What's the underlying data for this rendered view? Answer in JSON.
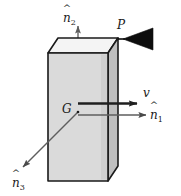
{
  "figure": {
    "type": "mechanics-free-body-diagram",
    "width": 181,
    "height": 196,
    "background_color": "#ffffff"
  },
  "labels": {
    "point_p": "P",
    "point_g": "G",
    "velocity": "v",
    "n1_base": "n",
    "n1_sub": "1",
    "n2_base": "n",
    "n2_sub": "2",
    "n3_base": "n",
    "n3_sub": "3",
    "hat_mark": "^"
  },
  "colors": {
    "outline": "#1a1a1a",
    "face_front": "#d9d9d9",
    "face_right": "#bdbdbd",
    "face_top": "#f2f2f2",
    "arrow_dark": "#1f1f1f",
    "arrow_gray": "#6e6e6e",
    "impactor_fill": "#0d0d0d"
  },
  "geometry": {
    "front_face": {
      "x": 48,
      "y": 53,
      "width": 60,
      "height": 128
    },
    "depth_offset": {
      "dx": 10,
      "dy": -15
    },
    "point_g": {
      "x": 78,
      "y": 112
    },
    "point_p": {
      "x": 118,
      "y": 38
    },
    "n1_arrow": {
      "x1": 78,
      "y1": 115,
      "x2": 152,
      "y2": 115
    },
    "n2_arrow": {
      "x1": 78,
      "y1": 112,
      "x2": 78,
      "y2": 26
    },
    "n3_arrow": {
      "x1": 78,
      "y1": 112,
      "x2": 19,
      "y2": 171
    },
    "v_arrow": {
      "x1": 78,
      "y1": 103,
      "x2": 144,
      "y2": 103
    },
    "impactor_triangle": {
      "apex_x": 122,
      "apex_y": 39,
      "base_x": 152,
      "top_y": 29,
      "bottom_y": 49
    }
  },
  "elements": [
    {
      "name": "rigid-body-prism",
      "kind": "shape"
    },
    {
      "name": "center-of-mass-marker",
      "kind": "point"
    },
    {
      "name": "impact-point-marker",
      "kind": "point"
    },
    {
      "name": "impactor-arrow",
      "kind": "shape"
    },
    {
      "name": "velocity-vector",
      "kind": "vector"
    },
    {
      "name": "unit-vector-n1",
      "kind": "vector"
    },
    {
      "name": "unit-vector-n2",
      "kind": "vector"
    },
    {
      "name": "unit-vector-n3",
      "kind": "vector"
    }
  ]
}
